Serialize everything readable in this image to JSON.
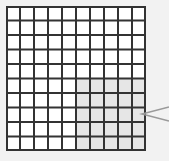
{
  "diagram": {
    "type": "grid",
    "rows": 10,
    "columns": 10,
    "shaded_region": {
      "row_start": 6,
      "row_end": 10,
      "col_start": 6,
      "col_end": 10,
      "cells": 25
    },
    "total_cells": 100,
    "colors": {
      "background": "#f2f2f2",
      "cell": "#ffffff",
      "shaded": "#e6e6e6",
      "line": "#333333",
      "pointer": "#999999"
    },
    "pointer": {
      "target": "shaded_region",
      "from": "right"
    }
  }
}
